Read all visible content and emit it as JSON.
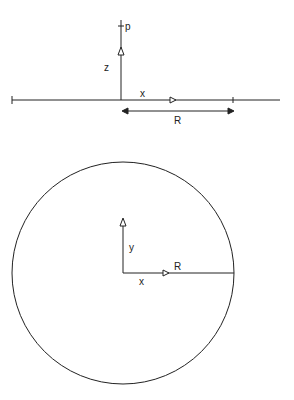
{
  "side_view": {
    "labels": {
      "point": "p",
      "vertical_axis": "z",
      "horizontal_axis": "x",
      "radius": "R"
    }
  },
  "top_view": {
    "labels": {
      "vertical_axis": "y",
      "horizontal_axis": "x",
      "radius": "R"
    }
  },
  "colors": {
    "line": "#222222",
    "background": "#ffffff"
  },
  "caption": {
    "text": ""
  }
}
